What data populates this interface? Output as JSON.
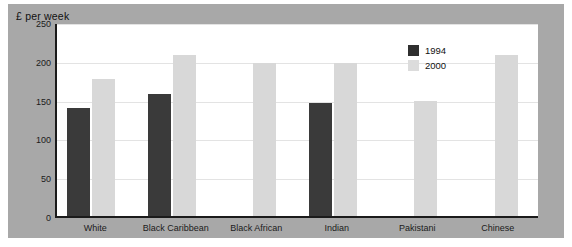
{
  "chart_data": {
    "type": "bar",
    "title": "£ per week",
    "xlabel": "",
    "ylabel": "",
    "ylim": [
      0,
      250
    ],
    "yticks": [
      0,
      50,
      100,
      150,
      200,
      250
    ],
    "grid": true,
    "legend_position": "top-right",
    "categories": [
      "White",
      "Black Caribbean",
      "Black African",
      "Indian",
      "Pakistani",
      "Chinese"
    ],
    "series": [
      {
        "name": "1994",
        "color": "#3a3a3a",
        "values": [
          139,
          157,
          null,
          146,
          null,
          null
        ]
      },
      {
        "name": "2000",
        "color": "#d8d8d8",
        "values": [
          176,
          207,
          197,
          197,
          148,
          208
        ]
      }
    ]
  },
  "legend": {
    "items": [
      {
        "label": "1994"
      },
      {
        "label": "2000"
      }
    ]
  }
}
